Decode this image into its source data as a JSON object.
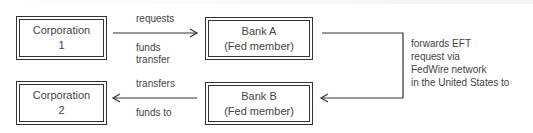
{
  "nodes": {
    "corp1": {
      "line1": "Corporation",
      "line2": "1"
    },
    "bankA": {
      "line1": "Bank A",
      "line2": "(Fed member)"
    },
    "corp2": {
      "line1": "Corporation",
      "line2": "2"
    },
    "bankB": {
      "line1": "Bank B",
      "line2": "(Fed member)"
    }
  },
  "edges": {
    "corp1_to_bankA": {
      "above": "requests",
      "below_1": "funds",
      "below_2": "transfer"
    },
    "bankA_to_bankB": {
      "line1": "forwards EFT",
      "line2": "request via",
      "line3": "FedWire network",
      "line4": "in the United States to"
    },
    "bankB_to_corp2": {
      "above": "transfers",
      "below": "funds to"
    }
  },
  "colors": {
    "stroke": "#333333",
    "text": "#444444"
  }
}
